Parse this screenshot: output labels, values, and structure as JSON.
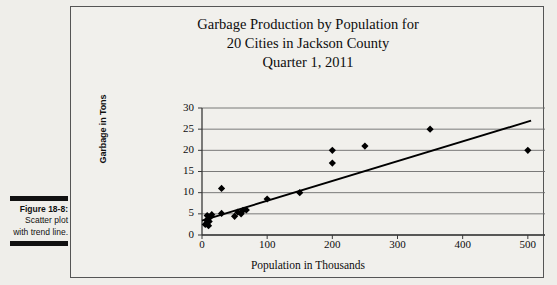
{
  "figure": {
    "label": "Figure 18-8:",
    "body": "Scatter plot with trend line."
  },
  "chart_data": {
    "type": "scatter",
    "title": "Garbage Production by Population for 20 Cities in Jackson County Quarter 1, 2011",
    "title_lines": [
      "Garbage Production by Population for",
      "20 Cities in Jackson County",
      "Quarter 1, 2011"
    ],
    "xlabel": "Population in Thousands",
    "ylabel": "Garbage in Tons",
    "xlim": [
      0,
      600
    ],
    "ylim": [
      0,
      30
    ],
    "xticks": [
      0,
      100,
      200,
      300,
      400,
      500,
      600
    ],
    "yticks": [
      0,
      5,
      10,
      15,
      20,
      25,
      30
    ],
    "grid": "horizontal",
    "legend": "none",
    "marker": "diamond",
    "marker_color": "#000000",
    "points": [
      {
        "x": 5,
        "y": 2.5
      },
      {
        "x": 7,
        "y": 3.5
      },
      {
        "x": 8,
        "y": 4.6
      },
      {
        "x": 10,
        "y": 2.2
      },
      {
        "x": 11,
        "y": 3.2
      },
      {
        "x": 13,
        "y": 4.3
      },
      {
        "x": 15,
        "y": 4.8
      },
      {
        "x": 30,
        "y": 5.1
      },
      {
        "x": 30,
        "y": 11.0
      },
      {
        "x": 50,
        "y": 4.4
      },
      {
        "x": 55,
        "y": 5.4
      },
      {
        "x": 60,
        "y": 5.0
      },
      {
        "x": 63,
        "y": 5.8
      },
      {
        "x": 68,
        "y": 5.9
      },
      {
        "x": 100,
        "y": 8.5
      },
      {
        "x": 150,
        "y": 10.0
      },
      {
        "x": 200,
        "y": 20.0
      },
      {
        "x": 200,
        "y": 17.0
      },
      {
        "x": 250,
        "y": 21.0
      },
      {
        "x": 350,
        "y": 25.0
      },
      {
        "x": 500,
        "y": 20.0
      }
    ],
    "trendline": {
      "x0": 0,
      "y0": 3.4,
      "x1": 505,
      "y1": 27.0,
      "color": "#000000"
    }
  }
}
